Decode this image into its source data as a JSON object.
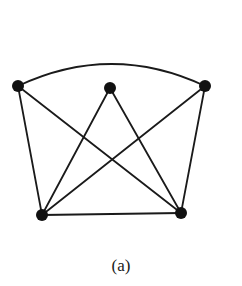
{
  "figure": {
    "caption": "(a)",
    "stroke_color": "#1a1a1a",
    "node_color": "#111111",
    "node_radius": 6,
    "stroke_width": 1.8
  },
  "graph": {
    "nodes": [
      {
        "id": "top-left",
        "x": 18,
        "y": 86
      },
      {
        "id": "top-middle",
        "x": 110,
        "y": 88
      },
      {
        "id": "top-right",
        "x": 205,
        "y": 86
      },
      {
        "id": "bottom-left",
        "x": 42,
        "y": 215
      },
      {
        "id": "bottom-right",
        "x": 181,
        "y": 213
      }
    ],
    "edges": [
      {
        "from": "top-left",
        "to": "top-right",
        "curve": "arc",
        "control_y": 42
      },
      {
        "from": "top-left",
        "to": "bottom-left"
      },
      {
        "from": "top-left",
        "to": "bottom-right"
      },
      {
        "from": "top-middle",
        "to": "bottom-left"
      },
      {
        "from": "top-middle",
        "to": "bottom-right"
      },
      {
        "from": "top-right",
        "to": "bottom-left"
      },
      {
        "from": "top-right",
        "to": "bottom-right"
      },
      {
        "from": "bottom-left",
        "to": "bottom-right"
      }
    ]
  }
}
